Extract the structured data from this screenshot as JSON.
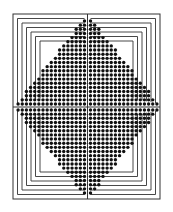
{
  "figure": {
    "colors": {
      "background": "#ffffff",
      "ink": "#111111",
      "line": "#333333"
    },
    "frame": {
      "x": 13,
      "y": 14,
      "w": 147,
      "h": 185
    },
    "center": {
      "x": 87.5,
      "y": 107
    },
    "dot_pitch": 4.15,
    "dot_radius": 1.7,
    "rows_per_half": 21,
    "max_cols_per_side": 17,
    "corner_lines": 6,
    "corner_line_spacing": 4.5
  }
}
